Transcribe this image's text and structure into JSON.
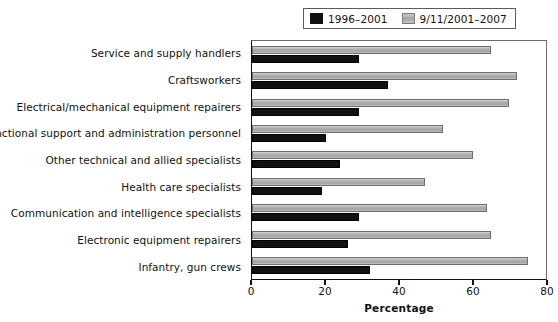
{
  "chart_data": {
    "type": "bar",
    "orientation": "horizontal",
    "title": "",
    "xlabel": "Percentage",
    "ylabel": "",
    "xlim": [
      0,
      80
    ],
    "xticks": [
      0,
      20,
      40,
      60,
      80
    ],
    "grid": false,
    "legend_position": "top-right",
    "categories": [
      "Service and supply handlers",
      "Craftsworkers",
      "Electrical/mechanical equipment repairers",
      "Functional support and administration personnel",
      "Other technical and allied specialists",
      "Health care specialists",
      "Communication and intelligence specialists",
      "Electronic equipment repairers",
      "Infantry, gun crews"
    ],
    "series": [
      {
        "name": "9/11/2001–2007",
        "color": "#b0b0b0",
        "values": [
          65,
          72,
          70,
          52,
          60,
          47,
          64,
          65,
          75
        ]
      },
      {
        "name": "1996–2001",
        "color": "#111111",
        "values": [
          29,
          37,
          29,
          20,
          24,
          19,
          29,
          26,
          32
        ]
      }
    ]
  },
  "legend": {
    "entries": [
      {
        "label": "1996–2001",
        "swatch": "black-swatch-icon"
      },
      {
        "label": "9/11/2001–2007",
        "swatch": "gray-swatch-icon"
      }
    ]
  },
  "axis": {
    "x_title": "Percentage",
    "x_tick_labels": [
      "0",
      "20",
      "40",
      "60",
      "80"
    ]
  }
}
